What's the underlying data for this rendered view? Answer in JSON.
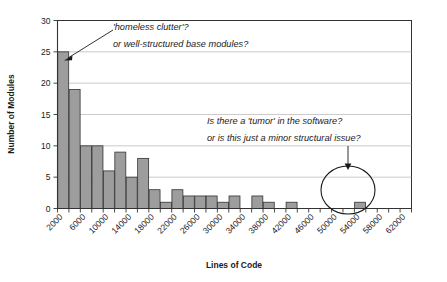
{
  "chart_data": {
    "type": "bar",
    "title": "",
    "xlabel": "Lines of Code",
    "ylabel": "Number of Modules",
    "ylim": [
      0,
      30
    ],
    "yticks": [
      0,
      5,
      10,
      15,
      20,
      25,
      30
    ],
    "grid": true,
    "legend": null,
    "bin_width": 2000,
    "categories": [
      "2000",
      "4000",
      "6000",
      "8000",
      "10000",
      "12000",
      "14000",
      "16000",
      "18000",
      "20000",
      "22000",
      "24000",
      "26000",
      "28000",
      "30000",
      "32000",
      "34000",
      "36000",
      "38000",
      "40000",
      "42000",
      "44000",
      "46000",
      "48000",
      "50000",
      "52000",
      "54000",
      "56000",
      "58000",
      "60000",
      "62000"
    ],
    "labeled_ticks": [
      "2000",
      "6000",
      "10000",
      "14000",
      "18000",
      "22000",
      "26000",
      "30000",
      "34000",
      "38000",
      "42000",
      "46000",
      "50000",
      "54000",
      "58000",
      "62000"
    ],
    "values": [
      25,
      19,
      10,
      10,
      6,
      9,
      5,
      8,
      3,
      1,
      3,
      2,
      2,
      2,
      1,
      2,
      0,
      2,
      1,
      0,
      1,
      0,
      0,
      0,
      0,
      0,
      1,
      0,
      0,
      0,
      0
    ],
    "annotations": [
      {
        "id": "annotation-homeless-clutter",
        "lines": [
          "'homeless clutter'?",
          "or well-structured base modules?"
        ],
        "points_to_category": "2000",
        "points_to_value": 24
      },
      {
        "id": "annotation-tumor",
        "lines": [
          "Is there a 'tumor' in the software?",
          "or is this just a minor structural issue?"
        ],
        "points_to_category": "58000",
        "points_to_value": 5
      }
    ],
    "highlight": {
      "id": "outlier-circle",
      "category": "58000",
      "shape": "ellipse"
    },
    "colors": {
      "bar_fill": "#9d9d9d",
      "bar_stroke": "#333333",
      "gridline": "#b4b4b4",
      "axis": "#333333",
      "text": "#1a1a1a",
      "background": "#ffffff"
    }
  }
}
